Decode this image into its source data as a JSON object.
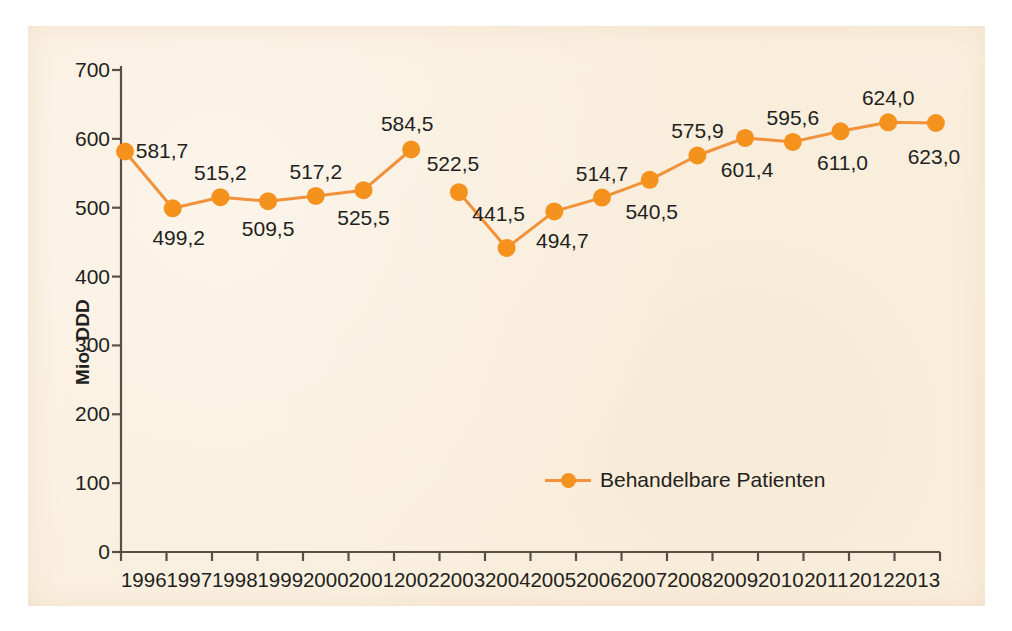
{
  "figure": {
    "background_color": "#faefde",
    "page_background": "#ffffff",
    "series_color": "#f5921e",
    "line_color": "#f1913a",
    "text_color": "#231f20"
  },
  "legend": {
    "position": "inside-bottom-center",
    "label": "Behandelbare Patienten",
    "marker": "line-with-circle-marker"
  },
  "chart_data": {
    "type": "line",
    "title": "",
    "xlabel": "",
    "ylabel": "Mio. DDD",
    "ylim": [
      0,
      700
    ],
    "yticks": [
      0,
      100,
      200,
      300,
      400,
      500,
      600,
      700
    ],
    "ytick_labels": [
      "0",
      "100",
      "200",
      "300",
      "400",
      "500",
      "600",
      "700"
    ],
    "grid": false,
    "legend_position": "inside-bottom-center",
    "categories": [
      "1996",
      "1997",
      "1998",
      "1999",
      "2000",
      "2001",
      "2002",
      "2003",
      "2004",
      "2005",
      "2006",
      "2007",
      "2008",
      "2009",
      "2010",
      "2011",
      "2012",
      "2013"
    ],
    "series": [
      {
        "name": "Behandelbare Patienten",
        "color": "#f5921e",
        "break_after_category": "2002",
        "values": [
          581.7,
          499.2,
          515.2,
          509.5,
          517.2,
          525.5,
          584.5,
          522.5,
          441.5,
          494.7,
          514.7,
          540.5,
          575.9,
          601.4,
          595.6,
          611.0,
          624.0,
          623.0
        ],
        "value_labels": [
          "581,7",
          "499,2",
          "515,2",
          "509,5",
          "517,2",
          "525,5",
          "584,5",
          "522,5",
          "441,5",
          "494,7",
          "514,7",
          "540,5",
          "575,9",
          "601,4",
          "595,6",
          "611,0",
          "624,0",
          "623,0"
        ],
        "label_placement": [
          "above",
          "below",
          "above",
          "below",
          "above",
          "below",
          "above",
          "above",
          "above",
          "below",
          "above",
          "below",
          "above",
          "below",
          "above",
          "below",
          "above",
          "below"
        ]
      }
    ]
  }
}
